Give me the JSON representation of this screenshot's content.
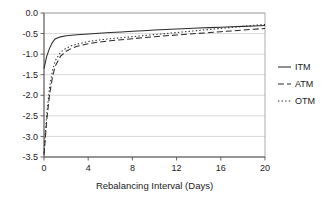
{
  "chart_data": {
    "type": "line",
    "title": "",
    "xlabel": "Rebalancing Interval (Days)",
    "ylabel": "",
    "xlim": [
      0,
      20
    ],
    "ylim": [
      -3.5,
      0.0
    ],
    "grid": "horizontal",
    "legend_position": "right",
    "x_ticks": [
      "0",
      "4",
      "8",
      "12",
      "16",
      "20"
    ],
    "x_tick_values": [
      0,
      4,
      8,
      12,
      16,
      20
    ],
    "y_ticks": [
      "0.0",
      "-0.5",
      "-1.0",
      "-1.5",
      "-2.0",
      "-2.5",
      "-3.0",
      "-3.5"
    ],
    "y_tick_values": [
      0.0,
      -0.5,
      -1.0,
      -1.5,
      -2.0,
      -2.5,
      -3.0,
      -3.5
    ],
    "x": [
      0,
      0.25,
      0.5,
      0.75,
      1,
      1.5,
      2,
      2.5,
      3,
      4,
      5,
      6,
      7,
      8,
      9,
      10,
      11,
      12,
      13,
      14,
      15,
      16,
      17,
      18,
      19,
      20
    ],
    "series": [
      {
        "name": "ITM",
        "style": "solid",
        "color": "#2b2b2b",
        "values": [
          -1.35,
          -1.05,
          -0.86,
          -0.72,
          -0.63,
          -0.58,
          -0.555,
          -0.54,
          -0.53,
          -0.51,
          -0.49,
          -0.475,
          -0.46,
          -0.445,
          -0.43,
          -0.415,
          -0.4,
          -0.39,
          -0.375,
          -0.365,
          -0.355,
          -0.345,
          -0.335,
          -0.325,
          -0.315,
          -0.305
        ]
      },
      {
        "name": "ATM",
        "style": "dashed",
        "color": "#2b2b2b",
        "values": [
          -3.45,
          -2.6,
          -2.0,
          -1.58,
          -1.3,
          -1.05,
          -0.93,
          -0.86,
          -0.81,
          -0.745,
          -0.705,
          -0.675,
          -0.65,
          -0.625,
          -0.6,
          -0.575,
          -0.555,
          -0.535,
          -0.515,
          -0.495,
          -0.475,
          -0.455,
          -0.435,
          -0.415,
          -0.395,
          -0.375
        ]
      },
      {
        "name": "OTM",
        "style": "dotted",
        "color": "#2b2b2b",
        "values": [
          -3.4,
          -2.45,
          -1.82,
          -1.42,
          -1.17,
          -0.95,
          -0.855,
          -0.795,
          -0.755,
          -0.695,
          -0.655,
          -0.625,
          -0.6,
          -0.575,
          -0.55,
          -0.525,
          -0.5,
          -0.475,
          -0.45,
          -0.425,
          -0.4,
          -0.375,
          -0.35,
          -0.325,
          -0.3,
          -0.28
        ]
      }
    ],
    "legend": [
      {
        "label": "ITM",
        "style": "solid"
      },
      {
        "label": "ATM",
        "style": "dashed"
      },
      {
        "label": "OTM",
        "style": "dotted"
      }
    ]
  }
}
